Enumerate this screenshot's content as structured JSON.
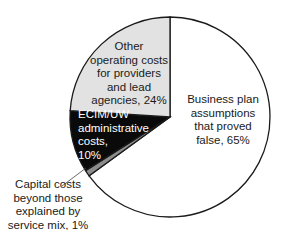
{
  "chart_data": {
    "type": "pie",
    "title": "",
    "start_angle": "top",
    "direction": "clockwise",
    "slices": [
      {
        "label": "Business plan assumptions that proved false",
        "value": 65,
        "color": "#ffffff"
      },
      {
        "label": "Capital costs beyond those explained by service mix",
        "value": 1,
        "color": "#8c8c8c"
      },
      {
        "label": "ECIM/UW administrative costs",
        "value": 10,
        "color": "#0a0a0a"
      },
      {
        "label": "Other operating costs for providers and lead agencies",
        "value": 24,
        "color": "#e2e2e2"
      }
    ],
    "legend": "none (direct labels)"
  },
  "labels": {
    "business": "Business plan\nassumptions\nthat proved\nfalse, 65%",
    "capital": "Capital costs\nbeyond those\nexplained by\nservice mix, 1%",
    "ecim": "ECIM/UW\nadministrative\ncosts,\n10%",
    "other": "Other\noperating costs\nfor providers\nand lead\nagencies, 24%"
  }
}
